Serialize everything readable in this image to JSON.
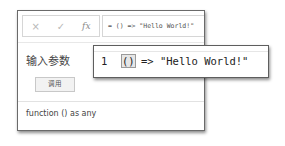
{
  "formula_bar": {
    "cancel_icon": "×",
    "confirm_icon": "✓",
    "fx_label": "fx",
    "formula": "= () => \"Hello World!\""
  },
  "panel": {
    "title": "输入参数",
    "invoke_button": "调用",
    "signature": "function () as any"
  },
  "editor_popup": {
    "line_number": "1",
    "code_open": "()",
    "code_rest": " => \"Hello World!\""
  }
}
